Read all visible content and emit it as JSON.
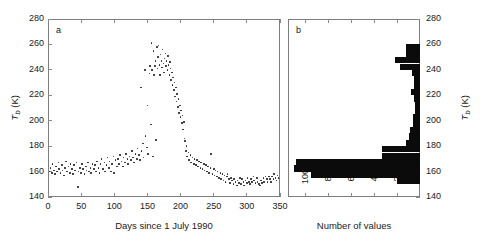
{
  "figure": {
    "panel_a_letter": "a",
    "panel_b_letter": "b"
  },
  "chart_data": [
    {
      "type": "scatter",
      "panel": "a",
      "title": "",
      "xlabel": "Days since 1 July 1990",
      "ylabel": "Tb (K)",
      "ylabel_rich": "T_b (K)",
      "xlim": [
        0,
        350
      ],
      "ylim": [
        140,
        280
      ],
      "xticks": [
        0,
        50,
        100,
        150,
        200,
        250,
        300,
        350
      ],
      "yticks": [
        140,
        160,
        180,
        200,
        220,
        240,
        260,
        280
      ],
      "grid": false,
      "legend": "none",
      "marker": "point",
      "points": [
        [
          2,
          160
        ],
        [
          4,
          163
        ],
        [
          6,
          159
        ],
        [
          7,
          166
        ],
        [
          9,
          161
        ],
        [
          11,
          158
        ],
        [
          12,
          164
        ],
        [
          14,
          160
        ],
        [
          16,
          167
        ],
        [
          17,
          162
        ],
        [
          19,
          159
        ],
        [
          21,
          165
        ],
        [
          22,
          161
        ],
        [
          24,
          157
        ],
        [
          26,
          163
        ],
        [
          27,
          168
        ],
        [
          29,
          160
        ],
        [
          31,
          164
        ],
        [
          33,
          159
        ],
        [
          34,
          166
        ],
        [
          36,
          162
        ],
        [
          38,
          158
        ],
        [
          39,
          165
        ],
        [
          41,
          161
        ],
        [
          43,
          167
        ],
        [
          45,
          148
        ],
        [
          46,
          160
        ],
        [
          48,
          163
        ],
        [
          50,
          159
        ],
        [
          51,
          166
        ],
        [
          53,
          162
        ],
        [
          55,
          158
        ],
        [
          57,
          164
        ],
        [
          58,
          161
        ],
        [
          60,
          167
        ],
        [
          62,
          160
        ],
        [
          64,
          163
        ],
        [
          65,
          159
        ],
        [
          67,
          166
        ],
        [
          69,
          162
        ],
        [
          71,
          165
        ],
        [
          72,
          160
        ],
        [
          74,
          168
        ],
        [
          76,
          163
        ],
        [
          78,
          159
        ],
        [
          79,
          166
        ],
        [
          81,
          170
        ],
        [
          83,
          162
        ],
        [
          85,
          167
        ],
        [
          86,
          160
        ],
        [
          88,
          165
        ],
        [
          90,
          171
        ],
        [
          92,
          163
        ],
        [
          93,
          168
        ],
        [
          95,
          160
        ],
        [
          97,
          166
        ],
        [
          99,
          172
        ],
        [
          100,
          159
        ],
        [
          102,
          169
        ],
        [
          104,
          164
        ],
        [
          106,
          170
        ],
        [
          107,
          166
        ],
        [
          109,
          173
        ],
        [
          111,
          168
        ],
        [
          113,
          164
        ],
        [
          114,
          171
        ],
        [
          116,
          167
        ],
        [
          118,
          174
        ],
        [
          120,
          170
        ],
        [
          121,
          166
        ],
        [
          123,
          172
        ],
        [
          125,
          169
        ],
        [
          127,
          176
        ],
        [
          128,
          171
        ],
        [
          130,
          167
        ],
        [
          132,
          174
        ],
        [
          134,
          170
        ],
        [
          135,
          178
        ],
        [
          137,
          173
        ],
        [
          139,
          169
        ],
        [
          140,
          226
        ],
        [
          141,
          176
        ],
        [
          143,
          182
        ],
        [
          144,
          171
        ],
        [
          146,
          240
        ],
        [
          147,
          188
        ],
        [
          149,
          179
        ],
        [
          150,
          212
        ],
        [
          151,
          174
        ],
        [
          153,
          237
        ],
        [
          154,
          243
        ],
        [
          155,
          197
        ],
        [
          156,
          261
        ],
        [
          157,
          240
        ],
        [
          158,
          172
        ],
        [
          159,
          255
        ],
        [
          160,
          236
        ],
        [
          161,
          243
        ],
        [
          162,
          247
        ],
        [
          163,
          185
        ],
        [
          164,
          258
        ],
        [
          165,
          241
        ],
        [
          166,
          250
        ],
        [
          167,
          259
        ],
        [
          168,
          244
        ],
        [
          169,
          236
        ],
        [
          170,
          252
        ],
        [
          171,
          247
        ],
        [
          172,
          242
        ],
        [
          173,
          256
        ],
        [
          174,
          245
        ],
        [
          175,
          238
        ],
        [
          176,
          249
        ],
        [
          177,
          253
        ],
        [
          178,
          243
        ],
        [
          179,
          247
        ],
        [
          180,
          240
        ],
        [
          181,
          251
        ],
        [
          182,
          244
        ],
        [
          183,
          236
        ],
        [
          184,
          246
        ],
        [
          185,
          241
        ],
        [
          186,
          232
        ],
        [
          187,
          238
        ],
        [
          188,
          228
        ],
        [
          189,
          234
        ],
        [
          190,
          224
        ],
        [
          191,
          230
        ],
        [
          192,
          219
        ],
        [
          193,
          226
        ],
        [
          194,
          215
        ],
        [
          195,
          221
        ],
        [
          196,
          211
        ],
        [
          197,
          217
        ],
        [
          198,
          206
        ],
        [
          199,
          212
        ],
        [
          200,
          203
        ],
        [
          201,
          208
        ],
        [
          202,
          198
        ],
        [
          203,
          204
        ],
        [
          204,
          193
        ],
        [
          205,
          199
        ],
        [
          206,
          186
        ],
        [
          207,
          184
        ],
        [
          208,
          176
        ],
        [
          209,
          180
        ],
        [
          210,
          172
        ],
        [
          212,
          175
        ],
        [
          213,
          169
        ],
        [
          215,
          173
        ],
        [
          216,
          167
        ],
        [
          218,
          171
        ],
        [
          220,
          166
        ],
        [
          221,
          170
        ],
        [
          223,
          165
        ],
        [
          225,
          169
        ],
        [
          226,
          164
        ],
        [
          228,
          168
        ],
        [
          230,
          163
        ],
        [
          231,
          167
        ],
        [
          233,
          162
        ],
        [
          235,
          166
        ],
        [
          236,
          161
        ],
        [
          238,
          165
        ],
        [
          240,
          160
        ],
        [
          241,
          164
        ],
        [
          243,
          159
        ],
        [
          245,
          163
        ],
        [
          246,
          174
        ],
        [
          248,
          158
        ],
        [
          250,
          162
        ],
        [
          251,
          157
        ],
        [
          253,
          161
        ],
        [
          255,
          156
        ],
        [
          256,
          160
        ],
        [
          258,
          155
        ],
        [
          260,
          159
        ],
        [
          261,
          154
        ],
        [
          263,
          158
        ],
        [
          265,
          153
        ],
        [
          266,
          157
        ],
        [
          268,
          152
        ],
        [
          270,
          156
        ],
        [
          271,
          158
        ],
        [
          273,
          154
        ],
        [
          275,
          151
        ],
        [
          276,
          155
        ],
        [
          278,
          153
        ],
        [
          280,
          150
        ],
        [
          281,
          154
        ],
        [
          283,
          152
        ],
        [
          285,
          149
        ],
        [
          286,
          153
        ],
        [
          288,
          151
        ],
        [
          290,
          155
        ],
        [
          291,
          150
        ],
        [
          293,
          154
        ],
        [
          295,
          152
        ],
        [
          296,
          149
        ],
        [
          298,
          153
        ],
        [
          300,
          151
        ],
        [
          301,
          155
        ],
        [
          303,
          152
        ],
        [
          305,
          150
        ],
        [
          306,
          154
        ],
        [
          308,
          152
        ],
        [
          310,
          156
        ],
        [
          311,
          153
        ],
        [
          313,
          151
        ],
        [
          315,
          155
        ],
        [
          316,
          152
        ],
        [
          318,
          150
        ],
        [
          320,
          149
        ],
        [
          321,
          153
        ],
        [
          323,
          151
        ],
        [
          325,
          155
        ],
        [
          326,
          152
        ],
        [
          328,
          156
        ],
        [
          330,
          154
        ],
        [
          331,
          152
        ],
        [
          333,
          156
        ],
        [
          335,
          154
        ],
        [
          336,
          152
        ],
        [
          338,
          156
        ],
        [
          340,
          154
        ],
        [
          341,
          158
        ],
        [
          343,
          155
        ],
        [
          345,
          153
        ],
        [
          346,
          157
        ],
        [
          348,
          155
        ]
      ]
    },
    {
      "type": "bar",
      "orientation": "horizontal",
      "panel": "b",
      "title": "",
      "xlabel": "Number of values",
      "ylabel": "Tb (K)",
      "ylabel_rich": "T_b (K)",
      "xlim": [
        0,
        115
      ],
      "xlim_reversed": true,
      "ylim": [
        140,
        280
      ],
      "xticks": [
        100,
        80,
        60,
        40,
        20
      ],
      "yticks": [
        140,
        160,
        180,
        200,
        220,
        240,
        260,
        280
      ],
      "grid": false,
      "legend": "none",
      "bin_width": 5,
      "bin_lows": [
        145,
        150,
        155,
        160,
        165,
        170,
        175,
        180,
        185,
        190,
        195,
        200,
        205,
        210,
        215,
        220,
        225,
        230,
        235,
        240,
        245,
        250,
        255
      ],
      "values": [
        0,
        20,
        95,
        110,
        108,
        33,
        33,
        12,
        10,
        9,
        6,
        6,
        4,
        4,
        5,
        8,
        5,
        5,
        7,
        17,
        22,
        12,
        12
      ]
    }
  ]
}
